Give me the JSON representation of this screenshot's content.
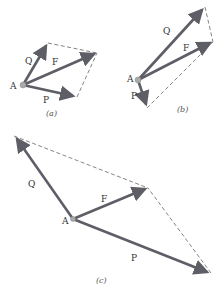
{
  "diagram": {
    "colors": {
      "vector": "#5e5e66",
      "dashed": "#666666",
      "point": "#aaaaaa"
    },
    "panels": [
      {
        "id": "a",
        "caption": "(a)",
        "origin": {
          "label": "A",
          "x": 23,
          "y": 85
        },
        "vectors": [
          {
            "label": "Q",
            "tip": [
              48,
              43
            ]
          },
          {
            "label": "F",
            "tip": [
              97,
              53
            ]
          },
          {
            "label": "P",
            "tip": [
              77,
              97
            ]
          }
        ]
      },
      {
        "id": "b",
        "caption": "(b)",
        "origin": {
          "label": "A",
          "x": 138,
          "y": 80
        },
        "vectors": [
          {
            "label": "Q",
            "tip": [
              205,
              7
            ]
          },
          {
            "label": "F",
            "tip": [
              213,
              42
            ]
          },
          {
            "label": "P",
            "tip": [
              147,
              108
            ]
          }
        ]
      },
      {
        "id": "c",
        "caption": "(c)",
        "origin": {
          "label": "A",
          "x": 73,
          "y": 219
        },
        "vectors": [
          {
            "label": "Q",
            "tip": [
              14,
              136
            ]
          },
          {
            "label": "F",
            "tip": [
              148,
              188
            ]
          },
          {
            "label": "P",
            "tip": [
              211,
              273
            ]
          }
        ]
      }
    ]
  }
}
